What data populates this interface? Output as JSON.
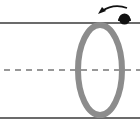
{
  "diagram": {
    "colors": {
      "background": "#ffffff",
      "cylinder_edge": "#3a3a3a",
      "axis_dash": "#333333",
      "ring": "#8c8c8c",
      "ball": "#111111",
      "arrow": "#111111"
    },
    "elements": {
      "cylinder_top_edge": {
        "y": 23
      },
      "cylinder_bottom_edge": {
        "y": 118
      },
      "axis_line": {
        "y": 70,
        "style": "dashed"
      },
      "ring": {
        "cx": 100,
        "cy": 70,
        "rx": 22,
        "ry": 46,
        "stroke_width": 6
      },
      "ball": {
        "cx": 124,
        "cy": 18,
        "r": 6
      },
      "rotation_arrow": {
        "direction": "counter-clockwise"
      }
    }
  }
}
